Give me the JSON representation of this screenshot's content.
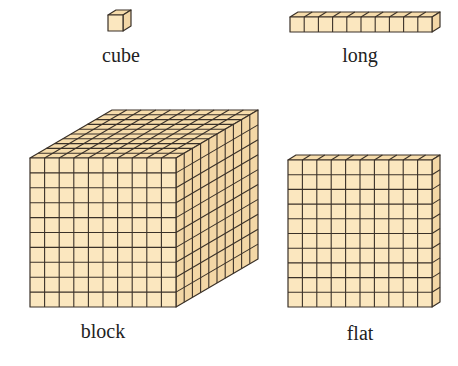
{
  "colors": {
    "fill": "#fbe7bf",
    "top": "#f6dcab",
    "side": "#f3d7a6",
    "stroke": "#3a3128"
  },
  "items": [
    {
      "id": "cube",
      "label": "cube",
      "units": [
        1,
        1,
        1
      ]
    },
    {
      "id": "long",
      "label": "long",
      "units": [
        10,
        1,
        1
      ]
    },
    {
      "id": "block",
      "label": "block",
      "units": [
        10,
        10,
        10
      ]
    },
    {
      "id": "flat",
      "label": "flat",
      "units": [
        10,
        10,
        1
      ]
    }
  ]
}
